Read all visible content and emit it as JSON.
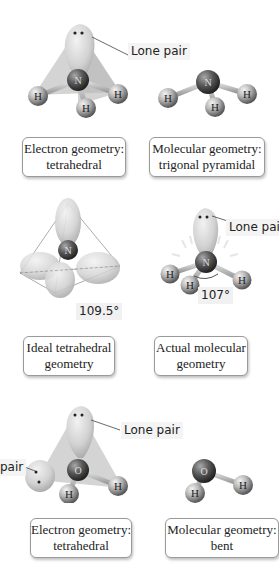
{
  "panels": [
    {
      "id": "ammonia-electron",
      "callout": "Lone pair",
      "atoms": {
        "center": "N",
        "outer": [
          "H",
          "H",
          "H"
        ]
      },
      "caption": {
        "line1": "Electron geometry:",
        "line2": "tetrahedral"
      }
    },
    {
      "id": "ammonia-molecular",
      "atoms": {
        "center": "N",
        "outer": [
          "H",
          "H",
          "H"
        ]
      },
      "caption": {
        "line1": "Molecular geometry:",
        "line2": "trigonal pyramidal"
      }
    },
    {
      "id": "ideal-tetrahedral",
      "atoms": {
        "center": "N"
      },
      "angle": "109.5°",
      "caption": {
        "line1": "Ideal tetrahedral",
        "line2": "geometry"
      }
    },
    {
      "id": "actual-molecular",
      "callout": "Lone pair",
      "atoms": {
        "center": "N",
        "outer": [
          "H",
          "H",
          "H"
        ]
      },
      "angle": "107°",
      "caption": {
        "line1": "Actual molecular",
        "line2": "geometry"
      }
    },
    {
      "id": "water-electron",
      "callout": "Lone pair",
      "callout_left": "pair",
      "atoms": {
        "center": "O",
        "outer": [
          "H",
          "H"
        ]
      },
      "caption": {
        "line1": "Electron geometry:",
        "line2": "tetrahedral"
      }
    },
    {
      "id": "water-molecular",
      "atoms": {
        "center": "O",
        "outer": [
          "H",
          "H"
        ]
      },
      "caption": {
        "line1": "Molecular geometry:",
        "line2": "bent"
      }
    }
  ],
  "colors": {
    "lobe": "#d8d8d8",
    "lobe_shadow": "#a8a8a8",
    "central_atom": "#5a5a5a",
    "hydrogen": "#b8b8b8",
    "tetra_face": "#c4c4c4"
  }
}
